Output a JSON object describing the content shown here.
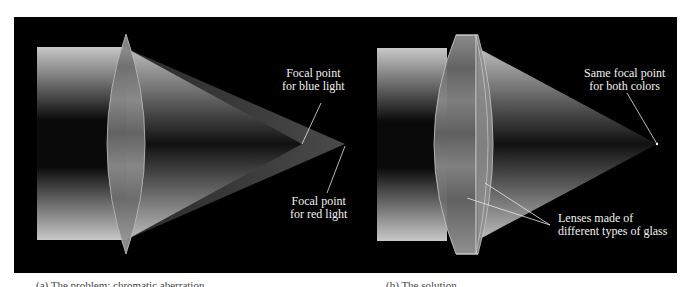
{
  "figure": {
    "background_color": "#000000",
    "page_color": "#ffffff",
    "panels": [
      {
        "id": "a",
        "title": "Single lens: chromatic aberration",
        "labels": {
          "blue_focal_line1": "Focal point",
          "blue_focal_line2": "for blue light",
          "red_focal_line1": "Focal point",
          "red_focal_line2": "for red light"
        },
        "caption": "(a) The problem: chromatic aberration"
      },
      {
        "id": "b",
        "title": "Achromatic lens: two glass types",
        "labels": {
          "same_focal_line1": "Same focal point",
          "same_focal_line2": "for both colors",
          "lenses_line1": "Lenses made of",
          "lenses_line2": "different types of glass"
        },
        "caption": "(b) The solution"
      }
    ]
  }
}
